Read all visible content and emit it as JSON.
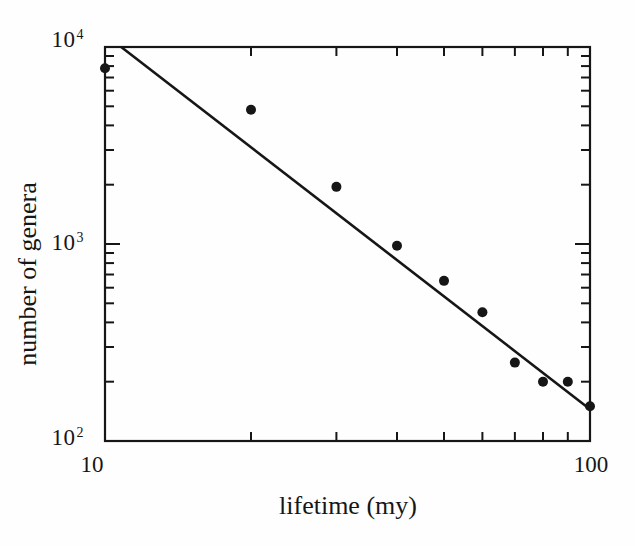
{
  "figure": {
    "background": "#fefefe",
    "ink_color": "#161616"
  },
  "chart_data": {
    "type": "scatter",
    "title": "",
    "xlabel": "lifetime (my)",
    "ylabel": "number of genera",
    "x_scale": "log",
    "y_scale": "log",
    "xlim": [
      10,
      100
    ],
    "ylim": [
      100,
      10000
    ],
    "grid": false,
    "legend": null,
    "x": [
      10,
      20,
      30,
      40,
      50,
      60,
      70,
      80,
      90,
      100
    ],
    "y": [
      7800,
      4800,
      1950,
      980,
      650,
      450,
      250,
      200,
      200,
      150
    ],
    "marker": {
      "shape": "filled-circle",
      "radius_px": 5
    },
    "fit_line": {
      "x1": 10.8,
      "y1": 10000,
      "x2": 100,
      "y2": 145
    },
    "x_major_ticks": [
      {
        "value": 10,
        "label": "10"
      },
      {
        "value": 100,
        "label": "100"
      }
    ],
    "y_major_ticks": [
      {
        "value": 10000,
        "base": "10",
        "exponent": "4"
      },
      {
        "value": 1000,
        "base": "10",
        "exponent": "3"
      },
      {
        "value": 100,
        "base": "10",
        "exponent": "2"
      }
    ],
    "x_minor_ticks": [
      20,
      30,
      40,
      50,
      60,
      70,
      80,
      90
    ],
    "y_minor_ticks": [
      200,
      300,
      400,
      500,
      600,
      700,
      800,
      900,
      2000,
      3000,
      4000,
      5000,
      6000,
      7000,
      8000,
      9000
    ]
  }
}
